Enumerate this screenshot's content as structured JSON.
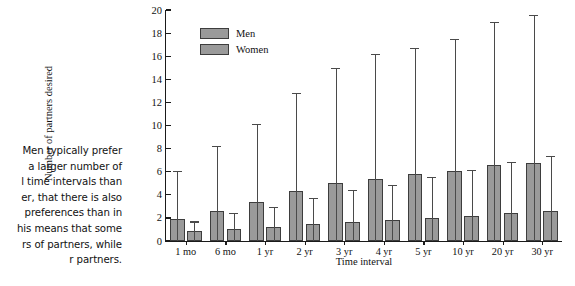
{
  "caption": {
    "lines": [
      "Men typically prefer",
      "a larger number of",
      "l time intervals than",
      "er, that there is also",
      "preferences than in",
      "his means that some",
      "rs of partners, while",
      "r partners."
    ]
  },
  "chart_data": {
    "type": "bar",
    "title": "",
    "xlabel": "Time interval",
    "ylabel": "Number of partners desired",
    "categories": [
      "1 mo",
      "6 mo",
      "1 yr",
      "2 yr",
      "3 yr",
      "4 yr",
      "5 yr",
      "10 yr",
      "20 yr",
      "30 yr"
    ],
    "ylim": [
      0,
      20
    ],
    "yticks": [
      0,
      2,
      4,
      6,
      8,
      10,
      12,
      14,
      16,
      18,
      20
    ],
    "grid": false,
    "legend_position": "upper-left-inside",
    "error_bars": "upper only",
    "series": [
      {
        "name": "Men",
        "color": "#9a9a9a",
        "values": [
          1.9,
          2.6,
          3.4,
          4.3,
          5.05,
          5.4,
          5.8,
          6.1,
          6.55,
          6.75
        ],
        "error_upper": [
          6.0,
          8.1,
          10.05,
          12.75,
          14.85,
          16.1,
          16.65,
          17.4,
          18.85,
          19.5
        ]
      },
      {
        "name": "Women",
        "color": "#9a9a9a",
        "values": [
          0.85,
          1.05,
          1.2,
          1.45,
          1.65,
          1.85,
          1.95,
          2.2,
          2.4,
          2.6
        ],
        "error_upper": [
          1.6,
          2.35,
          2.85,
          3.65,
          4.3,
          4.75,
          5.45,
          6.05,
          6.75,
          7.3
        ]
      }
    ]
  }
}
